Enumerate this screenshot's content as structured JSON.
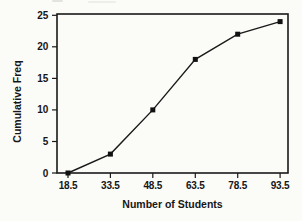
{
  "chart_data": {
    "type": "line",
    "title": "",
    "xlabel": "Number of Students",
    "ylabel": "Cumulative Freq",
    "series": [
      {
        "name": "Cumulative Frequency",
        "x": [
          18.5,
          33.5,
          48.5,
          63.5,
          78.5,
          93.5
        ],
        "y": [
          0,
          3,
          10,
          18,
          22,
          24
        ]
      }
    ],
    "x_ticks": [
      18.5,
      33.5,
      48.5,
      63.5,
      78.5,
      93.5
    ],
    "x_tick_labels": [
      "18.5",
      "33.5",
      "48.5",
      "63.5",
      "78.5",
      "93.5"
    ],
    "y_ticks": [
      0,
      5,
      10,
      15,
      20,
      25
    ],
    "y_tick_labels": [
      "0",
      "5",
      "10",
      "15",
      "20",
      "25"
    ],
    "xlim": [
      14.6,
      96.3
    ],
    "ylim": [
      0,
      25.2
    ],
    "grid": false,
    "legend": "none",
    "marker": "filled-square",
    "marker_size": 5,
    "line_color": "#1a1a1a",
    "marker_color": "#111111",
    "frame_color": "#1a1a1a",
    "text_color": "#161616",
    "background_color": "#fbfbf8"
  }
}
